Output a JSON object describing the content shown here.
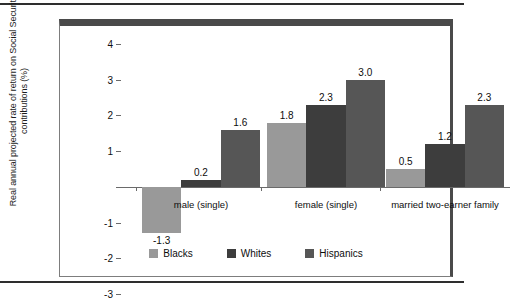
{
  "chart_data": {
    "type": "bar",
    "title": "",
    "subtitle": "",
    "xlabel": "",
    "ylabel": "Real annual projected rate of return on Social Security contributions (%)",
    "categories": [
      "male (single)",
      "female (single)",
      "married two-earner family"
    ],
    "series": [
      {
        "name": "Blacks",
        "color": "#999999",
        "values": [
          -1.3,
          1.8,
          0.5
        ],
        "labels": [
          "-1.3",
          "1.8",
          "0.5"
        ]
      },
      {
        "name": "Whites",
        "color": "#3d3d3d",
        "values": [
          0.2,
          2.3,
          1.2
        ],
        "labels": [
          "0.2",
          "2.3",
          "1.2"
        ]
      },
      {
        "name": "Hispanics",
        "color": "#565656",
        "values": [
          1.6,
          3.0,
          2.3
        ],
        "labels": [
          "1.6",
          "3.0",
          "2.3"
        ]
      }
    ],
    "ylim": [
      -3,
      4
    ],
    "yticks": [
      4,
      3,
      2,
      1,
      0,
      -1,
      -2,
      -3
    ],
    "ytick_labels": [
      "4",
      "3",
      "2",
      "1",
      "",
      "-1",
      "-2",
      "-3"
    ],
    "grid": false,
    "legend_position": "bottom",
    "legend": [
      "Blacks",
      "Whites",
      "Hispanics"
    ]
  },
  "frame": {
    "top_band_color": "#4a4a4a",
    "right_band_color": "#4a4a4a",
    "axis_color": "#7d7d7d"
  }
}
